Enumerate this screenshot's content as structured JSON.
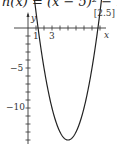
{
  "header": {
    "equation": "h(x) = (x − 5)² − 14",
    "reference": "[2.5]"
  },
  "axes": {
    "x_label": "x",
    "y_label": "y",
    "x_tick_labels": [
      "1",
      "3"
    ],
    "y_tick_labels": [
      "−5",
      "−10"
    ]
  },
  "chart_data": {
    "type": "line",
    "title": "h(x) = (x − 5)² − 14",
    "xlabel": "x",
    "ylabel": "y",
    "xlim": [
      -1,
      10
    ],
    "ylim": [
      -14,
      2
    ],
    "grid": false,
    "series": [
      {
        "name": "h(x) = (x − 5)² − 14",
        "x": [
          0,
          1,
          1.26,
          2,
          3,
          4,
          5,
          6,
          7,
          8,
          8.74,
          9
        ],
        "values": [
          11,
          2,
          0,
          -5,
          -10,
          -13,
          -14,
          -13,
          -10,
          -5,
          0,
          2
        ]
      }
    ],
    "annotations": [
      "[2.5]"
    ],
    "x_ticks": [
      1,
      2,
      3,
      4,
      5,
      6,
      7,
      8,
      9
    ],
    "y_ticks": [
      -1,
      -2,
      -3,
      -4,
      -5,
      -6,
      -7,
      -8,
      -9,
      -10,
      -11,
      -12,
      -13,
      -14
    ],
    "labeled_x_ticks": [
      1,
      3
    ],
    "labeled_y_ticks": [
      -5,
      -10
    ]
  }
}
